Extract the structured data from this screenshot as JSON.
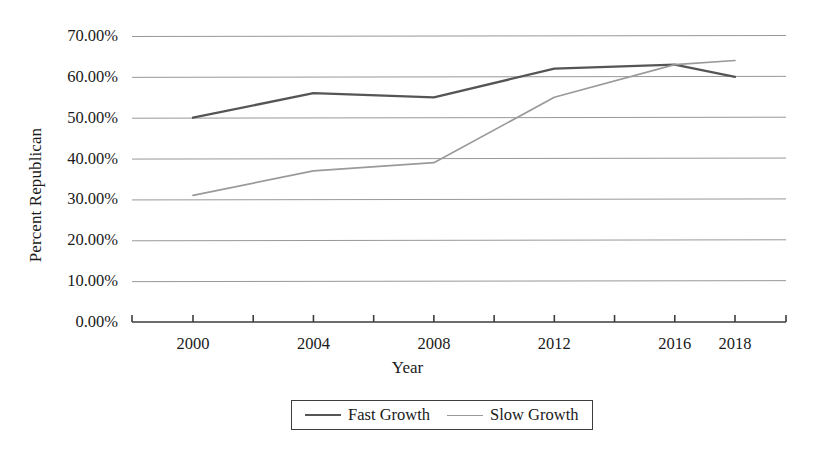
{
  "chart_data": {
    "type": "line",
    "title": "",
    "xlabel": "Year",
    "ylabel": "Percent Republican",
    "x": [
      2000,
      2002,
      2004,
      2006,
      2008,
      2010,
      2012,
      2014,
      2016,
      2018
    ],
    "categories": [
      "2000",
      "2004",
      "2008",
      "2012",
      "2016",
      "2018"
    ],
    "xtick_labels": [
      "2000",
      "",
      "2004",
      "",
      "2008",
      "",
      "2012",
      "",
      "2016",
      "2018"
    ],
    "ytick_labels": [
      "0.00%",
      "10.00%",
      "20.00%",
      "30.00%",
      "40.00%",
      "50.00%",
      "60.00%",
      "70.00%"
    ],
    "ytick_values": [
      0,
      10,
      20,
      30,
      40,
      50,
      60,
      70
    ],
    "ylim": [
      0,
      70
    ],
    "xlim": [
      2000,
      2018
    ],
    "grid": true,
    "legend_position": "bottom",
    "series": [
      {
        "name": "Fast Growth",
        "color": "#555555",
        "x": [
          2000,
          2004,
          2008,
          2012,
          2016,
          2018
        ],
        "values": [
          50.0,
          56.0,
          55.0,
          62.0,
          63.0,
          60.0
        ],
        "value_labels": [
          "50.00%",
          "56.00%",
          "55.00%",
          "62.00%",
          "63.00%",
          "60.00%"
        ]
      },
      {
        "name": "Slow Growth",
        "color": "#9a9a9a",
        "x": [
          2000,
          2004,
          2008,
          2012,
          2016,
          2018
        ],
        "values": [
          31.0,
          37.0,
          39.0,
          55.0,
          63.0,
          64.0
        ],
        "value_labels": [
          "31.00%",
          "37.00%",
          "39.00%",
          "55.00%",
          "63.00%",
          "64.00%"
        ]
      }
    ]
  },
  "legend": {
    "entries": [
      {
        "label": "Fast Growth",
        "color": "#555555"
      },
      {
        "label": "Slow Growth",
        "color": "#9a9a9a"
      }
    ]
  },
  "axes": {
    "y_title": "Percent Republican",
    "x_title": "Year"
  },
  "colors": {
    "axis": "#3d3d3d",
    "gridline": "#8c8c8c",
    "background": "#ffffff",
    "text": "#1a1a1a"
  }
}
